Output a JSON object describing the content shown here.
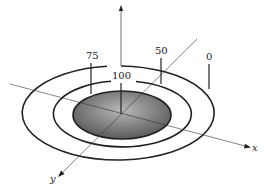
{
  "diagram": {
    "type": "contour-target",
    "axes": {
      "x_label": "x",
      "y_label": "y",
      "vertical_label": ""
    },
    "contours": [
      {
        "value_label": "0",
        "level": "outer"
      },
      {
        "value_label": "50",
        "level": "middle"
      },
      {
        "value_label": "75",
        "level": "middle-left"
      },
      {
        "value_label": "100",
        "level": "center"
      }
    ],
    "labels": {
      "l0": "0",
      "l50": "50",
      "l75": "75",
      "l100": "100"
    },
    "colors": {
      "line": "#222222",
      "fill_dark": "#555555",
      "fill_light": "#b5b5b5",
      "background": "#ffffff"
    }
  }
}
